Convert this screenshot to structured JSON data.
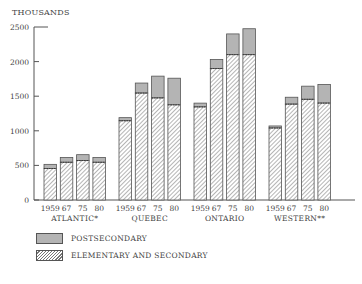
{
  "chart_data": {
    "type": "bar",
    "stacked": true,
    "title": "",
    "ylabel": "THOUSANDS",
    "xlabel": "",
    "ylim": [
      0,
      2500
    ],
    "yticks": [
      0,
      500,
      1000,
      1500,
      2000,
      2500
    ],
    "grid": false,
    "legend_position": "bottom-left",
    "groups": [
      {
        "name": "ATLANTIC*",
        "categories": [
          "1959",
          "67",
          "75",
          "80"
        ]
      },
      {
        "name": "QUEBEC",
        "categories": [
          "1959",
          "67",
          "75",
          "80"
        ]
      },
      {
        "name": "ONTARIO",
        "categories": [
          "1959",
          "67",
          "75",
          "80"
        ]
      },
      {
        "name": "WESTERN**",
        "categories": [
          "1959",
          "67",
          "75",
          "80"
        ]
      }
    ],
    "series": [
      {
        "name": "ELEMENTARY AND SECONDARY",
        "pattern": "hatched",
        "values": [
          [
            455,
            545,
            570,
            545
          ],
          [
            1145,
            1545,
            1475,
            1375
          ],
          [
            1345,
            1900,
            2100,
            2100
          ],
          [
            1040,
            1385,
            1455,
            1400
          ]
        ]
      },
      {
        "name": "POSTSECONDARY",
        "pattern": "solid-gray",
        "values": [
          [
            60,
            70,
            85,
            70
          ],
          [
            45,
            145,
            315,
            385
          ],
          [
            55,
            130,
            300,
            375
          ],
          [
            30,
            100,
            190,
            270
          ]
        ]
      }
    ],
    "totals": [
      [
        515,
        615,
        655,
        615
      ],
      [
        1190,
        1690,
        1790,
        1760
      ],
      [
        1400,
        2030,
        2400,
        2475
      ],
      [
        1070,
        1485,
        1645,
        1670
      ]
    ]
  },
  "legend": {
    "post_label": "POSTSECONDARY",
    "elem_label": "ELEMENTARY AND SECONDARY"
  },
  "axis": {
    "y_title": "THOUSANDS"
  },
  "colors": {
    "postsecondary": "#b4b4b4",
    "hatch_line": "#777777",
    "outline": "#555555",
    "axis": "#555555"
  }
}
